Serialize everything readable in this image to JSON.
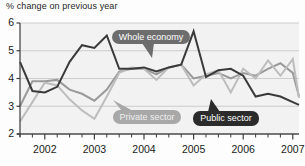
{
  "chart_data": {
    "type": "line",
    "title": "% change on previous year",
    "xlabel": "",
    "ylabel": "",
    "ylim": [
      2,
      6
    ],
    "xlim": [
      2001.5,
      2007.125
    ],
    "grid": true,
    "legend_position": "inline-callouts",
    "yticks": [
      2,
      3,
      4,
      5,
      6
    ],
    "ytick_labels": [
      "2",
      "3",
      "4",
      "5",
      "6"
    ],
    "xticks": [
      2002,
      2003,
      2004,
      2005,
      2006,
      2007
    ],
    "xtick_labels": [
      "2002",
      "2003",
      "2004",
      "2005",
      "2006",
      "2007"
    ],
    "x_minor_interval": 0.25,
    "x": [
      2001.5,
      2001.75,
      2002.0,
      2002.25,
      2002.5,
      2002.75,
      2003.0,
      2003.25,
      2003.5,
      2003.75,
      2004.0,
      2004.25,
      2004.5,
      2004.75,
      2005.0,
      2005.25,
      2005.5,
      2005.75,
      2006.0,
      2006.25,
      2006.5,
      2006.75,
      2007.0,
      2007.125
    ],
    "series": [
      {
        "name": "Whole economy",
        "color": "#9a9a9a",
        "width": 2.0,
        "values": [
          3.0,
          3.9,
          3.9,
          3.95,
          3.6,
          3.45,
          3.2,
          3.6,
          4.25,
          4.35,
          4.35,
          4.15,
          4.4,
          4.5,
          4.0,
          4.1,
          4.2,
          4.0,
          4.2,
          4.1,
          4.35,
          4.55,
          4.2,
          3.35
        ]
      },
      {
        "name": "Private sector",
        "color": "#bdbdbd",
        "width": 2.0,
        "values": [
          2.45,
          3.15,
          3.85,
          3.75,
          3.25,
          2.85,
          2.55,
          3.35,
          4.2,
          4.4,
          4.35,
          3.95,
          4.4,
          4.5,
          3.75,
          4.15,
          4.3,
          3.5,
          4.35,
          4.0,
          4.65,
          4.1,
          4.7,
          3.3
        ]
      },
      {
        "name": "Public sector",
        "color": "#3a3a3a",
        "width": 2.0,
        "values": [
          4.6,
          3.55,
          3.5,
          3.7,
          4.6,
          5.2,
          5.1,
          5.55,
          4.35,
          4.35,
          4.4,
          4.25,
          4.4,
          4.5,
          5.7,
          4.05,
          4.3,
          4.35,
          4.1,
          3.35,
          3.45,
          3.35,
          3.15,
          3.05
        ]
      }
    ],
    "annotations": [
      {
        "label": "Whole economy",
        "style": "callout-dark",
        "bg": "#6d6d6d",
        "text_color": "#ffffff",
        "box": {
          "x": 112,
          "y": 30,
          "w": 78,
          "h": 14
        },
        "pointer": {
          "x": 148,
          "y": 44,
          "tip_x": 152,
          "tip_y": 58,
          "dir": "down"
        }
      },
      {
        "label": "Private sector",
        "style": "callout-light",
        "bg": "#a8a8a8",
        "text_color": "#efefef",
        "box": {
          "x": 113,
          "y": 110,
          "w": 68,
          "h": 14
        },
        "pointer": {
          "x": 122,
          "y": 110,
          "tip_x": 113,
          "tip_y": 100,
          "dir": "up-left"
        }
      },
      {
        "label": "Public sector",
        "style": "callout-black",
        "bg": "#2b2b2b",
        "text_color": "#ffffff",
        "box": {
          "x": 193,
          "y": 111,
          "w": 66,
          "h": 15
        },
        "pointer": {
          "x": 214,
          "y": 111,
          "tip_x": 211,
          "tip_y": 99,
          "dir": "up"
        }
      }
    ]
  },
  "colors": {
    "background": "#fdfdfd",
    "plot_background": "#f2f2f2",
    "gridline": "#c3c3c3",
    "axis": "#4a4a4a",
    "text": "#1b1b1b"
  }
}
